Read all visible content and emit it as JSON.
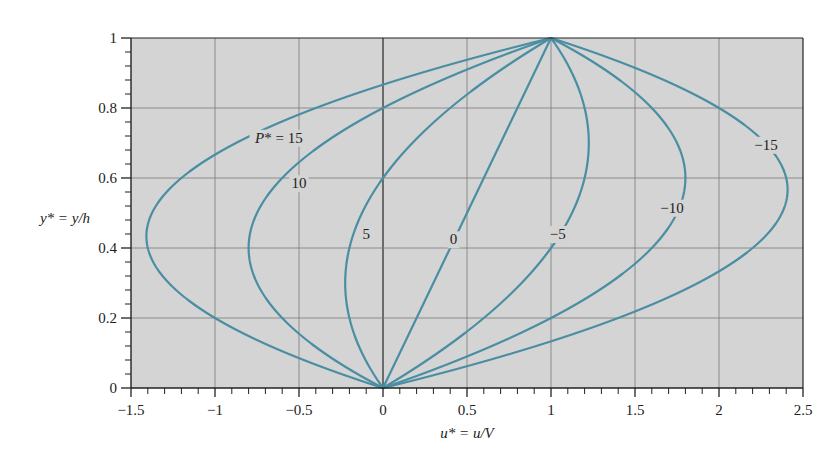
{
  "chart_data": {
    "type": "line",
    "title": "",
    "xlabel": "u* = u/V",
    "ylabel": "y* = y/h",
    "xlim": [
      -1.5,
      2.5
    ],
    "ylim": [
      0,
      1
    ],
    "grid": true,
    "x_ticks": [
      -1.5,
      -1,
      -0.5,
      0,
      0.5,
      1,
      1.5,
      2,
      2.5
    ],
    "x_tick_labels": [
      "−1.5",
      "−1",
      "−0.5",
      "0",
      "0.5",
      "1",
      "1.5",
      "2",
      "2.5"
    ],
    "y_ticks": [
      0,
      0.2,
      0.4,
      0.6,
      0.8,
      1
    ],
    "y_tick_labels": [
      "0",
      "0.2",
      "0.4",
      "0.6",
      "0.8",
      "1"
    ],
    "relation": "u* = y* - (P*/2) y* (1 - y*)",
    "y": [
      0,
      0.05,
      0.1,
      0.15,
      0.2,
      0.25,
      0.3,
      0.35,
      0.4,
      0.45,
      0.5,
      0.55,
      0.6,
      0.65,
      0.7,
      0.75,
      0.8,
      0.85,
      0.9,
      0.95,
      1.0
    ],
    "series": [
      {
        "name": "P* = 15",
        "label": "P* = 15",
        "P": 15,
        "u": [
          0,
          -0.306,
          -0.575,
          -0.806,
          -1.0,
          -1.156,
          -1.275,
          -1.356,
          -1.4,
          -1.406,
          -1.375,
          -1.306,
          -1.2,
          -1.056,
          -0.875,
          -0.656,
          -0.4,
          -0.106,
          0.225,
          0.594,
          1.0
        ]
      },
      {
        "name": "P* = 10",
        "label": "10",
        "P": 10,
        "u": [
          0,
          -0.188,
          -0.35,
          -0.488,
          -0.6,
          -0.688,
          -0.75,
          -0.788,
          -0.8,
          -0.788,
          -0.75,
          -0.688,
          -0.6,
          -0.488,
          -0.35,
          -0.188,
          0.0,
          0.213,
          0.45,
          0.713,
          1.0
        ]
      },
      {
        "name": "P* = 5",
        "label": "5",
        "P": 5,
        "u": [
          0,
          -0.069,
          -0.125,
          -0.169,
          -0.2,
          -0.219,
          -0.225,
          -0.219,
          -0.2,
          -0.169,
          -0.125,
          -0.069,
          0.0,
          0.081,
          0.175,
          0.281,
          0.4,
          0.531,
          0.675,
          0.831,
          1.0
        ]
      },
      {
        "name": "P* = 0",
        "label": "0",
        "P": 0,
        "u": [
          0,
          0.05,
          0.1,
          0.15,
          0.2,
          0.25,
          0.3,
          0.35,
          0.4,
          0.45,
          0.5,
          0.55,
          0.6,
          0.65,
          0.7,
          0.75,
          0.8,
          0.85,
          0.9,
          0.95,
          1.0
        ]
      },
      {
        "name": "P* = -5",
        "label": "−5",
        "P": -5,
        "u": [
          0,
          0.169,
          0.325,
          0.469,
          0.6,
          0.719,
          0.825,
          0.919,
          1.0,
          1.069,
          1.125,
          1.169,
          1.2,
          1.219,
          1.225,
          1.219,
          1.2,
          1.169,
          1.125,
          1.069,
          1.0
        ]
      },
      {
        "name": "P* = -10",
        "label": "−10",
        "P": -10,
        "u": [
          0,
          0.288,
          0.55,
          0.788,
          1.0,
          1.188,
          1.35,
          1.488,
          1.6,
          1.688,
          1.75,
          1.788,
          1.8,
          1.788,
          1.75,
          1.688,
          1.6,
          1.488,
          1.35,
          1.188,
          1.0
        ]
      },
      {
        "name": "P* = -15",
        "label": "−15",
        "P": -15,
        "u": [
          0,
          0.406,
          0.775,
          1.106,
          1.4,
          1.656,
          1.875,
          2.056,
          2.2,
          2.306,
          2.375,
          2.406,
          2.4,
          2.356,
          2.275,
          2.156,
          2.0,
          1.806,
          1.575,
          1.306,
          1.0
        ]
      }
    ],
    "curve_labels": [
      {
        "text": "P* = 15",
        "x": -0.62,
        "y": 0.715
      },
      {
        "text": "10",
        "x": -0.5,
        "y": 0.585
      },
      {
        "text": "5",
        "x": -0.1,
        "y": 0.44
      },
      {
        "text": "0",
        "x": 0.42,
        "y": 0.425
      },
      {
        "text": "−5",
        "x": 1.04,
        "y": 0.44
      },
      {
        "text": "−10",
        "x": 1.72,
        "y": 0.515
      },
      {
        "text": "−15",
        "x": 2.28,
        "y": 0.695
      }
    ],
    "colors": {
      "curve": "#4a8ea4",
      "plot_bg": "#d3d4d3",
      "grid": "#7a7a7a",
      "zero_line": "#333333",
      "axis": "#222222"
    }
  }
}
